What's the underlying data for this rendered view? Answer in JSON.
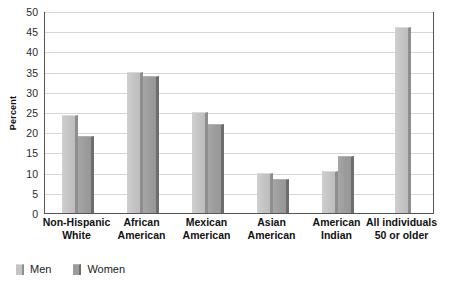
{
  "chart_data": {
    "type": "bar",
    "title": "",
    "xlabel": "",
    "ylabel": "Percent",
    "ylim": [
      0,
      50
    ],
    "yticks": [
      0,
      5,
      10,
      15,
      20,
      25,
      30,
      35,
      40,
      45,
      50
    ],
    "grid": true,
    "legend_position": "bottom-left",
    "categories": [
      "Non-Hispanic White",
      "African American",
      "Mexican American",
      "Asian American",
      "American Indian",
      "All individuals 50 or older"
    ],
    "category_lines": [
      [
        "Non-Hispanic",
        "White"
      ],
      [
        "African",
        "American"
      ],
      [
        "Mexican",
        "American"
      ],
      [
        "Asian",
        "American"
      ],
      [
        "American",
        "Indian"
      ],
      [
        "All individuals",
        "50 or older"
      ]
    ],
    "series": [
      {
        "name": "Men",
        "color": "#c4c4c4",
        "values": [
          24.3,
          35.0,
          25.0,
          9.8,
          10.3,
          46.0
        ]
      },
      {
        "name": "Women",
        "color": "#9c9c9c",
        "values": [
          19.0,
          34.0,
          22.0,
          8.4,
          14.0,
          null
        ]
      }
    ]
  },
  "axis": {
    "y_title": "Percent"
  },
  "legend": {
    "items": [
      {
        "label": "Men",
        "swatch": "men-swatch"
      },
      {
        "label": "Women",
        "swatch": "women-swatch"
      }
    ]
  },
  "colors": {
    "men": "#c4c4c4",
    "women": "#9c9c9c",
    "gridline": "#d8d8d8",
    "axis": "#555555",
    "text": "#111111",
    "background": "#ffffff"
  }
}
